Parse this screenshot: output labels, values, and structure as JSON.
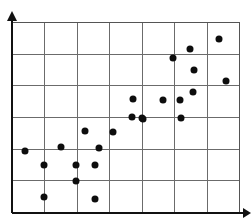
{
  "chart_data": {
    "type": "scatter",
    "title": "",
    "subtitle": "",
    "xlabel": "",
    "ylabel": "",
    "xlim": [
      0,
      7
    ],
    "ylim": [
      0,
      6
    ],
    "xticks": [
      0,
      1,
      2,
      3,
      4,
      5,
      6,
      7
    ],
    "yticks": [
      0,
      1,
      2,
      3,
      4,
      5,
      6
    ],
    "xtick_labels": [],
    "ytick_labels": [],
    "grid": true,
    "grid_columns": 7,
    "grid_rows": 6,
    "legend": null,
    "legend_position": "none",
    "annotations": [],
    "marker": "filled-circle",
    "marker_color": "#0d0d0d",
    "marker_size_px": 7,
    "n_points": 24,
    "relationship": "positive correlation",
    "series": [
      {
        "name": "observations",
        "color": "#0d0d0d",
        "x": [
          0.99,
          2.0,
          2.0,
          2.57,
          1.48,
          2.29,
          2.71,
          3.71,
          0.4,
          3.11,
          3.72,
          4.65,
          4.03,
          5.2,
          5.19,
          4.04,
          5.56,
          5.6,
          6.58,
          6.38,
          5.47,
          4.95,
          1.0,
          2.55
        ],
        "y": [
          0.52,
          1.52,
          1.0,
          1.51,
          2.06,
          2.55,
          2.03,
          2.98,
          2.05,
          2.52,
          3.55,
          3.54,
          3.02,
          3.02,
          3.5,
          3.01,
          3.92,
          4.63,
          4.3,
          5.62,
          5.3,
          5.02,
          1.56,
          0.5
        ],
        "points_px": [
          {
            "x": 44,
            "y": 197
          },
          {
            "x": 76,
            "y": 165
          },
          {
            "x": 76,
            "y": 181
          },
          {
            "x": 95,
            "y": 165
          },
          {
            "x": 61,
            "y": 147
          },
          {
            "x": 85,
            "y": 131
          },
          {
            "x": 99,
            "y": 148
          },
          {
            "x": 132,
            "y": 117
          },
          {
            "x": 25,
            "y": 151
          },
          {
            "x": 113,
            "y": 132
          },
          {
            "x": 133,
            "y": 99
          },
          {
            "x": 163,
            "y": 100
          },
          {
            "x": 142,
            "y": 118
          },
          {
            "x": 181,
            "y": 118
          },
          {
            "x": 180,
            "y": 100
          },
          {
            "x": 143,
            "y": 119
          },
          {
            "x": 193,
            "y": 92
          },
          {
            "x": 194,
            "y": 70
          },
          {
            "x": 226,
            "y": 81
          },
          {
            "x": 219,
            "y": 39
          },
          {
            "x": 190,
            "y": 49
          },
          {
            "x": 173,
            "y": 58
          },
          {
            "x": 44,
            "y": 165
          },
          {
            "x": 95,
            "y": 199
          }
        ]
      }
    ]
  },
  "axes": {
    "x_axis_name": "horizontal-axis",
    "y_axis_name": "vertical-axis",
    "x_arrow": "right-arrow",
    "y_arrow": "up-arrow"
  }
}
